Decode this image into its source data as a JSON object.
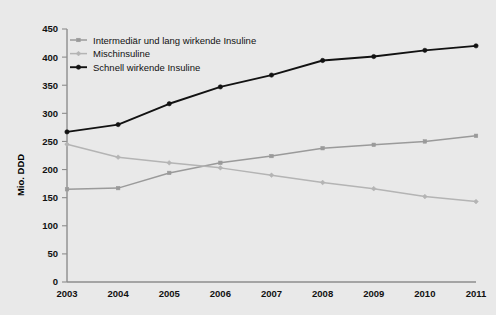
{
  "chart_data": {
    "type": "line",
    "title": "",
    "subtitle": "",
    "xlabel": "",
    "ylabel": "Mio. DDD",
    "categories": [
      "2003",
      "2004",
      "2005",
      "2006",
      "2007",
      "2008",
      "2009",
      "2010",
      "2011"
    ],
    "x": [
      2003,
      2004,
      2005,
      2006,
      2007,
      2008,
      2009,
      2010,
      2011
    ],
    "xlim": [
      2003,
      2011
    ],
    "ylim": [
      0,
      450
    ],
    "yticks": [
      0,
      50,
      100,
      150,
      200,
      250,
      300,
      350,
      400,
      450
    ],
    "ytick_labels": [
      "0",
      "50",
      "100",
      "150",
      "200",
      "250",
      "300",
      "350",
      "400",
      "450"
    ],
    "grid": false,
    "legend_position": "top-left",
    "series": [
      {
        "name": "Intermediär und lang wirkende Insuline",
        "color": "#9a9a9a",
        "marker": "square",
        "values": [
          165,
          167,
          194,
          212,
          224,
          238,
          244,
          250,
          260
        ]
      },
      {
        "name": "Mischinsuline",
        "color": "#b4b4b4",
        "marker": "diamond",
        "values": [
          245,
          222,
          212,
          203,
          190,
          177,
          166,
          152,
          143
        ]
      },
      {
        "name": "Schnell wirkende Insuline",
        "color": "#121212",
        "marker": "circle",
        "values": [
          267,
          280,
          317,
          347,
          368,
          394,
          401,
          412,
          420
        ]
      }
    ]
  },
  "legend": {
    "items": [
      {
        "label": "Intermediär und lang wirkende Insuline"
      },
      {
        "label": "Mischinsuline"
      },
      {
        "label": "Schnell wirkende Insuline"
      }
    ]
  },
  "axes": {
    "y_axis_title": "Mio. DDD"
  },
  "colors": {
    "background": "#e9e9e9",
    "axis": "#8d8d8d",
    "text": "#111111",
    "series_intermediate": "#9a9a9a",
    "series_mixed": "#b4b4b4",
    "series_fast": "#121212"
  }
}
